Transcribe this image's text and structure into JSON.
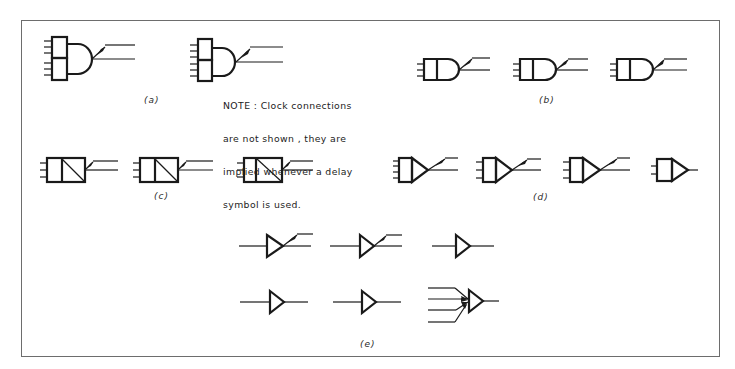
{
  "figure": {
    "panels": [
      {
        "id": "a",
        "label": "(a)",
        "symbols": 2,
        "description": "Two-stacked-box inputs feeding AND (D) gate with delay output"
      },
      {
        "id": "b",
        "label": "(b)",
        "symbols": 3,
        "description": "Box + D gate with delay output"
      },
      {
        "id": "c",
        "label": "(c)",
        "symbols": 3,
        "description": "Rectangular element with diagonal divider and delay output"
      },
      {
        "id": "d",
        "label": "(d)",
        "symbols": 4,
        "description": "Box + triangle (amplifier) with delay output; last without delay"
      },
      {
        "id": "e",
        "label": "(e)",
        "symbols": 6,
        "description": "Triangle buffer variants: with delay, plain, and multi-input arrows"
      }
    ],
    "note": {
      "lines": [
        "NOTE : Clock connections",
        "are not shown , they are",
        "implied whenever a delay",
        "symbol is used."
      ]
    }
  },
  "labels": {
    "a": "(a)",
    "b": "(b)",
    "c": "(c)",
    "d": "(d)",
    "e": "(e)"
  },
  "colors": {
    "stroke": "#1a1a1a",
    "frame": "#6d6d6d",
    "background": "#ffffff"
  }
}
